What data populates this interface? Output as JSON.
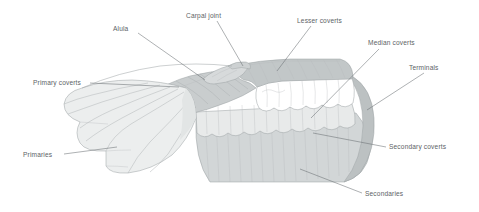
{
  "figure": {
    "kind": "anatomical-diagram",
    "background_color": "#ffffff",
    "label_color": "#5d6366",
    "leader_color": "#6a7073"
  },
  "palette": {
    "primaries": "#eceeee",
    "primaries_shadow": "#e2e5e5",
    "primary_coverts": "#c9cdce",
    "alula": "#d7dadb",
    "lesser_coverts": "#c2c7c8",
    "median_coverts": "#ffffff",
    "secondary_coverts": "#e8eaea",
    "secondaries": "#d2d6d7",
    "terminals": "#bcc1c2",
    "outline": "#9aa0a2"
  },
  "labels": [
    {
      "id": "alula",
      "text": "Alula",
      "x": 113,
      "y": 31,
      "anchor": "start"
    },
    {
      "id": "carpal-joint",
      "text": "Carpal joint",
      "x": 186,
      "y": 18,
      "anchor": "start"
    },
    {
      "id": "lesser-coverts",
      "text": "Lesser coverts",
      "x": 297,
      "y": 23,
      "anchor": "start"
    },
    {
      "id": "median-coverts",
      "text": "Median coverts",
      "x": 368,
      "y": 45,
      "anchor": "start"
    },
    {
      "id": "terminals",
      "text": "Terminals",
      "x": 409,
      "y": 70,
      "anchor": "start"
    },
    {
      "id": "primary-coverts",
      "text": "Primary coverts",
      "x": 33,
      "y": 85,
      "anchor": "start"
    },
    {
      "id": "secondary-coverts",
      "text": "Secondary coverts",
      "x": 389,
      "y": 149,
      "anchor": "start"
    },
    {
      "id": "secondaries",
      "text": "Secondaries",
      "x": 365,
      "y": 196,
      "anchor": "start"
    },
    {
      "id": "primaries",
      "text": "Primaries",
      "x": 23,
      "y": 157,
      "anchor": "start"
    }
  ],
  "leaders": [
    {
      "id": "alula-leader",
      "d": "M 138 33 L 205 80"
    },
    {
      "id": "carpal-joint-leader",
      "d": "M 217 21 L 243 66"
    },
    {
      "id": "lesser-coverts-leader",
      "d": "M 311 26 L 277 71"
    },
    {
      "id": "median-coverts-leader",
      "d": "M 379 49 L 311 118"
    },
    {
      "id": "terminals-leader",
      "d": "M 424 73 L 367 110"
    },
    {
      "id": "primary-coverts-leader",
      "d": "M 90 83 L 179 87"
    },
    {
      "id": "secondary-coverts-leader",
      "d": "M 386 147 L 313 133"
    },
    {
      "id": "secondaries-leader",
      "d": "M 362 193 L 300 169"
    },
    {
      "id": "primaries-leader",
      "d": "M 64 154 L 117 147"
    }
  ],
  "regions": [
    {
      "id": "primaries",
      "name": "Primaries",
      "feather_count": 10
    },
    {
      "id": "primary-coverts",
      "name": "Primary coverts",
      "feather_count": 9
    },
    {
      "id": "alula",
      "name": "Alula",
      "feather_count": 3
    },
    {
      "id": "carpal-joint",
      "name": "Carpal joint",
      "feather_count": 0
    },
    {
      "id": "lesser-coverts",
      "name": "Lesser coverts",
      "feather_count": 8
    },
    {
      "id": "median-coverts",
      "name": "Median coverts",
      "feather_count": 9
    },
    {
      "id": "secondary-coverts",
      "name": "Secondary coverts",
      "feather_count": 10
    },
    {
      "id": "secondaries",
      "name": "Secondaries",
      "feather_count": 14
    },
    {
      "id": "terminals",
      "name": "Terminals",
      "feather_count": 0
    }
  ]
}
